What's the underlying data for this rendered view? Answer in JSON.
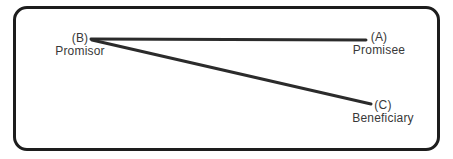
{
  "diagram": {
    "nodes": [
      {
        "id": "B",
        "label": "(B)",
        "role": "Promisor"
      },
      {
        "id": "A",
        "label": "(A)",
        "role": "Promisee"
      },
      {
        "id": "C",
        "label": "(C)",
        "role": "Beneficiary"
      }
    ],
    "edges": [
      {
        "from": "B",
        "to": "A"
      },
      {
        "from": "B",
        "to": "C"
      }
    ],
    "colors": {
      "line": "#2b2b2b",
      "border": "#1d1d1d",
      "text": "#383838",
      "background": "#ffffff"
    }
  }
}
